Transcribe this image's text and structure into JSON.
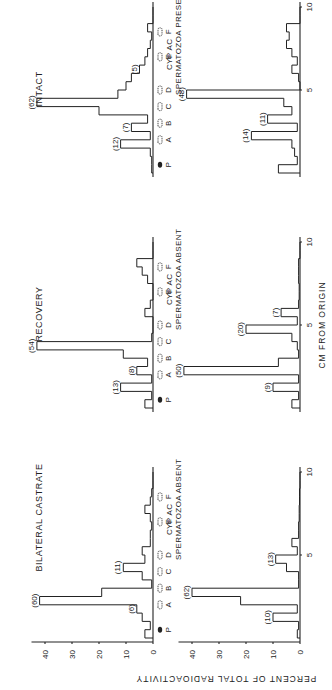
{
  "figure": {
    "orientation": "rotated 90 degrees counter-clockwise",
    "y_axis_title": "PERCENT OF TOTAL RADIOACTIVITY",
    "x_axis_title": "CM FROM ORIGIN",
    "y_ticks": [
      "0",
      "10",
      "20",
      "30",
      "40"
    ],
    "x_ticks": [
      "5",
      "10"
    ],
    "spot_markers": [
      "P",
      "A",
      "B",
      "C",
      "D",
      "E",
      "F"
    ]
  },
  "panels": [
    {
      "id": "castrate",
      "title": "BILATERAL CASTRATE",
      "note_line1": "CYP AC",
      "note_line2": "SPERMATOZOA ABSENT"
    },
    {
      "id": "recovery",
      "title": "RECOVERY",
      "note_line1": "CYP AC",
      "note_line2": "SPERMATOZOA ABSENT"
    },
    {
      "id": "intact",
      "title": "INTACT",
      "note_line1": "CYP AC",
      "note_line2": "SPERMATOZOA PRESENT"
    }
  ],
  "chart_data": [
    {
      "type": "bar",
      "title": "BILATERAL CASTRATE (top)",
      "xlabel": "CM FROM ORIGIN",
      "ylabel": "PERCENT OF TOTAL RADIOACTIVITY",
      "ylim": [
        0,
        45
      ],
      "x": [
        0.5,
        1,
        1.5,
        2,
        2.5,
        3,
        3.5,
        4,
        4.5,
        5,
        5.5,
        6,
        6.5,
        7,
        7.5,
        8,
        8.5,
        9,
        9.5
      ],
      "values": [
        3,
        1,
        4,
        6,
        42,
        19,
        0.5,
        4,
        11,
        3,
        4,
        1,
        1,
        0.5,
        1,
        3,
        1,
        0.5,
        0
      ],
      "annotations": [
        {
          "label": "(6)",
          "x": 2
        },
        {
          "label": "(60)",
          "x": 2.5
        },
        {
          "label": "(11)",
          "x": 4.5
        }
      ],
      "spots": [
        "P",
        "A",
        "B",
        "C",
        "D",
        "E",
        "F"
      ]
    },
    {
      "type": "bar",
      "title": "BILATERAL CASTRATE (bottom) - CYP AC SPERMATOZOA ABSENT",
      "xlabel": "CM FROM ORIGIN",
      "ylabel": "PERCENT OF TOTAL RADIOACTIVITY",
      "ylim": [
        0,
        45
      ],
      "x": [
        0.5,
        1,
        1.5,
        2,
        2.5,
        3,
        3.5,
        4,
        4.5,
        5,
        5.5,
        6,
        6.5,
        7,
        7.5,
        8,
        8.5,
        9,
        9.5
      ],
      "values": [
        1,
        0.5,
        10,
        1,
        22,
        40,
        0.5,
        0.5,
        5,
        9,
        1,
        3,
        0.5,
        0.5,
        0.3,
        0.3,
        0.2,
        0.2,
        0
      ],
      "annotations": [
        {
          "label": "(10)",
          "x": 1.5
        },
        {
          "label": "(62)",
          "x": 3
        },
        {
          "label": "(13)",
          "x": 5
        }
      ]
    },
    {
      "type": "bar",
      "title": "RECOVERY (top)",
      "xlabel": "CM FROM ORIGIN",
      "ylabel": "PERCENT OF TOTAL RADIOACTIVITY",
      "ylim": [
        0,
        45
      ],
      "x": [
        0.5,
        1,
        1.5,
        2,
        2.5,
        3,
        3.5,
        4,
        4.5,
        5,
        5.5,
        6,
        6.5,
        7,
        7.5,
        8,
        8.5,
        9,
        9.5
      ],
      "values": [
        3,
        0.5,
        12,
        0.5,
        6,
        2,
        11,
        43,
        0.5,
        0,
        0,
        3,
        1,
        0,
        0,
        2,
        4,
        6,
        0
      ],
      "annotations": [
        {
          "label": "(13)",
          "x": 1.5
        },
        {
          "label": "(8)",
          "x": 2.5
        },
        {
          "label": "(54)",
          "x": 4
        }
      ],
      "spots": [
        "P",
        "A",
        "B",
        "C",
        "D",
        "E",
        "F"
      ]
    },
    {
      "type": "bar",
      "title": "RECOVERY (bottom) - CYP AC SPERMATOZOA ABSENT",
      "xlabel": "CM FROM ORIGIN",
      "ylabel": "PERCENT OF TOTAL RADIOACTIVITY",
      "ylim": [
        0,
        45
      ],
      "x": [
        0.5,
        1,
        1.5,
        2,
        2.5,
        3,
        3.5,
        4,
        4.5,
        5,
        5.5,
        6,
        6.5,
        7,
        7.5,
        8,
        8.5,
        9,
        9.5
      ],
      "values": [
        3,
        0.5,
        10,
        0.5,
        43,
        8,
        0.5,
        1,
        3,
        20,
        1,
        7,
        0.5,
        0.3,
        0.3,
        0.5,
        0.5,
        0.5,
        0
      ],
      "annotations": [
        {
          "label": "(9)",
          "x": 1.5
        },
        {
          "label": "(50)",
          "x": 2.5
        },
        {
          "label": "(20)",
          "x": 5
        },
        {
          "label": "(7)",
          "x": 6
        }
      ]
    },
    {
      "type": "bar",
      "title": "INTACT (top)",
      "xlabel": "CM FROM ORIGIN",
      "ylabel": "PERCENT OF TOTAL RADIOACTIVITY",
      "ylim": [
        0,
        45
      ],
      "x": [
        0.5,
        1,
        1.5,
        2,
        2.5,
        3,
        3.5,
        4,
        4.5,
        5,
        5.5,
        6,
        6.5,
        7,
        7.5,
        8,
        8.5,
        9,
        9.5
      ],
      "values": [
        0.5,
        0.5,
        1,
        12,
        1,
        8,
        2,
        20,
        43,
        13,
        10,
        8,
        5,
        3,
        2,
        1,
        0.5,
        2,
        0
      ],
      "annotations": [
        {
          "label": "(12)",
          "x": 2
        },
        {
          "label": "(7)",
          "x": 3
        },
        {
          "label": "(62)",
          "x": 4.5
        },
        {
          "label": "(5)",
          "x": 6.5
        }
      ],
      "spots": [
        "P",
        "A",
        "B",
        "C",
        "D",
        "E",
        "F"
      ]
    },
    {
      "type": "bar",
      "title": "INTACT (bottom) - CYP AC SPERMATOZOA PRESENT",
      "xlabel": "CM FROM ORIGIN",
      "ylabel": "PERCENT OF TOTAL RADIOACTIVITY",
      "ylim": [
        0,
        45
      ],
      "x": [
        0.5,
        1,
        1.5,
        2,
        2.5,
        3,
        3.5,
        4,
        4.5,
        5,
        5.5,
        6,
        6.5,
        7,
        7.5,
        8,
        8.5,
        9,
        9.5
      ],
      "values": [
        8,
        1,
        2,
        3,
        18,
        1,
        12,
        3,
        6,
        42,
        0,
        0.5,
        3,
        1,
        3,
        5,
        4,
        5,
        0
      ],
      "annotations": [
        {
          "label": "(14)",
          "x": 2.5
        },
        {
          "label": "(11)",
          "x": 3.5
        },
        {
          "label": "(48)",
          "x": 5
        }
      ]
    }
  ]
}
